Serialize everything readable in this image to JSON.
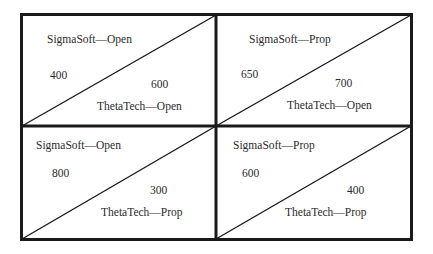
{
  "diagram": {
    "type": "payoff-matrix",
    "players": [
      "SigmaSoft",
      "ThetaTech"
    ],
    "strategies": [
      "Open",
      "Prop"
    ],
    "cells": [
      {
        "row": "Open",
        "col": "Open",
        "top_label": "SigmaSoft—Open",
        "top_value": "400",
        "bottom_value": "600",
        "bottom_label": "ThetaTech—Open"
      },
      {
        "row": "Prop",
        "col": "Open",
        "top_label": "SigmaSoft—Prop",
        "top_value": "650",
        "bottom_value": "700",
        "bottom_label": "ThetaTech—Open"
      },
      {
        "row": "Open",
        "col": "Prop",
        "top_label": "SigmaSoft—Open",
        "top_value": "800",
        "bottom_value": "300",
        "bottom_label": "ThetaTech—Prop"
      },
      {
        "row": "Prop",
        "col": "Prop",
        "top_label": "SigmaSoft—Prop",
        "top_value": "600",
        "bottom_value": "400",
        "bottom_label": "ThetaTech—Prop"
      }
    ],
    "colors": {
      "line": "#1a1a1a",
      "text": "#2a2a2a",
      "background": "#ffffff"
    }
  }
}
